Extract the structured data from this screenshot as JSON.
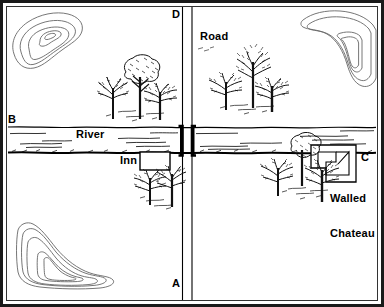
{
  "map": {
    "title": "Terrain sketch map",
    "style": {
      "ink": "#000000",
      "paper": "#ffffff",
      "frame": "#1a1a1a",
      "contour": "#555555",
      "vegetation": "#222222"
    },
    "quadrant_labels": [
      {
        "id": "quadrant-label-d",
        "text": "D",
        "x": 172,
        "y": 9
      },
      {
        "id": "quadrant-label-b",
        "text": "B",
        "x": 8,
        "y": 114
      },
      {
        "id": "quadrant-label-c",
        "text": "C",
        "x": 361,
        "y": 152
      },
      {
        "id": "quadrant-label-a",
        "text": "A",
        "x": 172,
        "y": 278
      }
    ],
    "feature_labels": [
      {
        "id": "label-road",
        "text": "Road",
        "x": 200,
        "y": 31
      },
      {
        "id": "label-river",
        "text": "River",
        "x": 76,
        "y": 129
      },
      {
        "id": "label-inn",
        "text": "Inn",
        "x": 120,
        "y": 155
      }
    ],
    "multiline_labels": [
      {
        "id": "label-walled-chateau",
        "lines": [
          "Walled",
          "Chateau"
        ],
        "x": 330,
        "y": 170
      }
    ],
    "features": {
      "road": {
        "name": "Road",
        "orientation": "vertical",
        "x_left": 182,
        "x_right": 192
      },
      "river": {
        "name": "River",
        "orientation": "horizontal",
        "y_top": 127,
        "y_bottom": 153
      },
      "bridge": {
        "name": "Bridge",
        "x": 187,
        "y_top": 126,
        "y_bottom": 155
      },
      "inn": {
        "name": "Inn",
        "x": 140,
        "y": 152,
        "width": 30,
        "height": 18
      },
      "walled_chateau": {
        "name": "Walled Chateau",
        "x": 311,
        "y": 144,
        "width": 45,
        "height": 38
      }
    },
    "hills": [
      {
        "id": "hill-northwest",
        "rings": 3
      },
      {
        "id": "hill-northeast",
        "rings": 3
      },
      {
        "id": "hill-southwest",
        "rings": 3
      }
    ],
    "woods": [
      {
        "id": "woods-northwest",
        "trees": 3
      },
      {
        "id": "woods-northeast",
        "trees": 3
      },
      {
        "id": "woods-southwest",
        "trees": 2
      },
      {
        "id": "woods-southeast",
        "trees": 3
      }
    ]
  }
}
